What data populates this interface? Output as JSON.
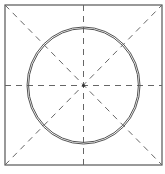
{
  "diagram": {
    "title": "",
    "colors": {
      "background": "#ffffff",
      "square_stroke": "#555555",
      "circle_stroke": "#555555",
      "dash_stroke": "#666666",
      "center_mark": "#333333"
    },
    "square": {
      "x": 5,
      "y": 5,
      "width": 157,
      "height": 160
    },
    "circle": {
      "cx": 83.5,
      "cy": 85.5,
      "rx": 56.5,
      "ry": 58.5,
      "inner_gap": 1.6
    },
    "center": {
      "x": 83.5,
      "y": 85.5
    },
    "guides": [
      {
        "name": "horizontal",
        "x1": 5,
        "y1": 85.5,
        "x2": 162,
        "y2": 85.5
      },
      {
        "name": "vertical",
        "x1": 83.5,
        "y1": 5,
        "x2": 83.5,
        "y2": 165
      },
      {
        "name": "diagonal-tl-br",
        "x1": 5,
        "y1": 5,
        "x2": 162,
        "y2": 165
      },
      {
        "name": "diagonal-bl-tr",
        "x1": 5,
        "y1": 165,
        "x2": 162,
        "y2": 5
      }
    ]
  }
}
